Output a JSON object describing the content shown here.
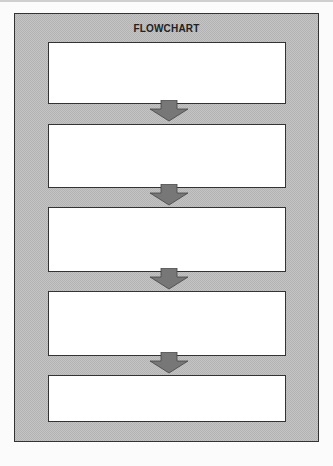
{
  "title": "FLOWCHART",
  "boxes": [
    {
      "label": ""
    },
    {
      "label": ""
    },
    {
      "label": ""
    },
    {
      "label": ""
    },
    {
      "label": ""
    }
  ],
  "colors": {
    "frame_fill": "#c4c4c4",
    "border": "#333333",
    "arrow_fill": "#777777",
    "box_fill": "#ffffff"
  }
}
